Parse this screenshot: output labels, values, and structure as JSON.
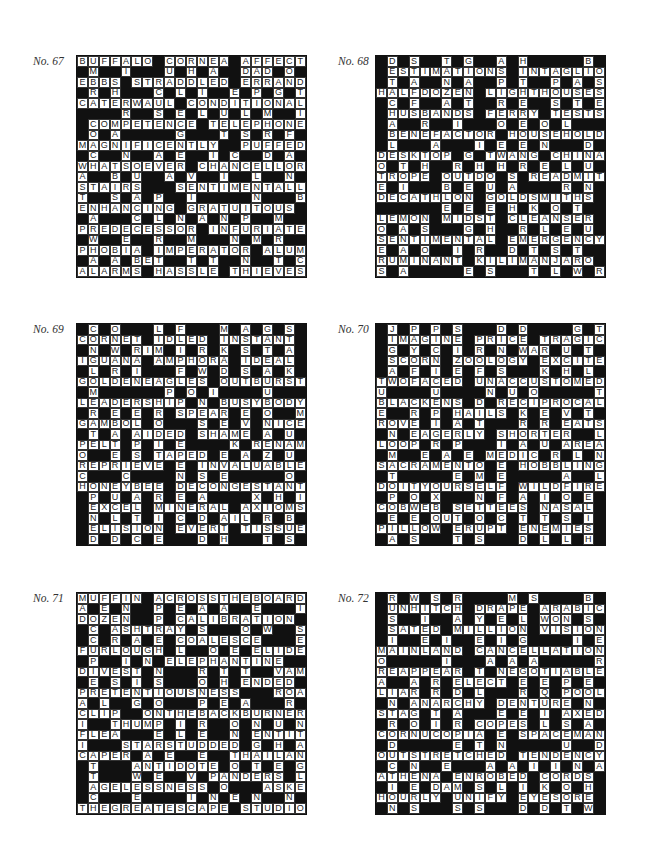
{
  "page": {
    "puzzles": [
      {
        "label": "No. 67",
        "rows": [
          "BUFFALO#CORNEA#AFFECT",
          "#M##I###U#H#A##DAD#O#O",
          "EBBS#STRADDLED#ERRAND",
          "#R#H###C#L#I##E#P#G#T",
          "CATERWAUL#CONDITIONAL",
          "####R##S#E#L#U#L#M##I",
          "#COMPETENCE#TELEPHONE",
          "#O#A#####G###T#S#R#F#I",
          "MAGNIFICENTLY##PUFFED",
          "#C##N##A#E##I#C##D#A#E",
          "WHATSOEVER#CHANCELLOR",
          "A##B#U##A#V##I##L##N#G",
          "STAIRS###SENTIMENTALLY",
          "T##S#A#P##I#####N###B#E",
          "ENHANCING#GRATUITOUS#",
          "#A###C#L#N#A#N#P##M##",
          "PREDECESSOR#INFURIATE",
          "#W##E##R##M###N#M#R##N#R",
          "PHOBIA#IMPERATOR#ALUM",
          "#A#A#BET##T#T##N##T#C",
          "ALARMS#HASSLE#THIEVES"
        ]
      },
      {
        "label": "No. 68",
        "rows": [
          "#D#S##T#G##A#H#####B#B",
          "#ESTIMATIONS#INTAGLIO",
          "#T#A##N#A##P#T##P#A#S",
          "HALFDOZEN#LIGHTHOUSES",
          "#C#F##A#T##R#E##S#T#E",
          "#HUSBANDS#FERRY#TESTS",
          "#A##R##I###O#E#O#L###",
          "#BENEFACTOR#HOUSEHOLD",
          "#L###A###I#E#E#N###D#R",
          "DESKTOP#G#TWANG#CHINA",
          "O#T#H##R#H#H#R#E#L#U#F",
          "TROPE#OUTDO#S#READMIT",
          "E#I###B#E#U#A####R#N#",
          "DECATHLON#GOLDSMITHS",
          "######E#E#E#H#K#O#T",
          "LEMON#MIDST#CLEANSER",
          "O#A#S###G#H##R#L#E#U",
          "SENTIMENTAL#EMERGENCY",
          "E#A#O##I#R##D#T#S#T",
          "RUMINANT#KILIMANJARO",
          "S#A#####E#S###T#L#W#R"
        ]
      },
      {
        "label": "No. 69",
        "rows": [
          "#C#O###L#F###M#A#G#S#",
          "CORNET#IDLED#INSTANT",
          "#N#W#RIM#I#R#K#S#T#A",
          "IGUANA#AMPHORA#IDEAL",
          "#L#R#I###F#W#D#S#A#K",
          "GOLDENEAGLES#OUTBURST",
          "#M######P#O#I####U###H",
          "LEADERSHIP#N#BUSYBODY",
          "#R#E#E#R#SPEAR#E#O##M",
          "GAMBOL#O###S#E#V#NICE",
          "#T#A#AIDED#SHAME#A#U",
          "PELT#P#I#E####K#RENAME",
          "O##E#S#TAPED#E#A#Z#U",
          "REPRIEVE#E#INVALUABLE",
          "C###C####N#S#E#####O",
          "HONEYBEE#DECONGESTANT",
          "#P#U#A#R#E#A####X#H#I",
          "#EXCEL#MINERAL#AXIOMS",
          "#N#L#T#I#C#D#AIL#R#B",
          "#ELISION#EVERT#TISSUE",
          "#D#D#C#E###D#H###T#S"
        ]
      },
      {
        "label": "No. 70",
        "rows": [
          "#J#P#P#S###D#D####G#T",
          "#IMAGINE#PRICE#TRAGIC",
          "#G#Y#C#I#R#N#WAR#U#T",
          "#SCORN#ZOOLOGY#EXCITE",
          "#A#F#I#E#F#S###K#H#L",
          "TWOFACED#UNACCUSTOMED",
          "U####U####N#U#O#####T",
          "BLACKENS#D#RECIPROCAL",
          "E##R#P#HAILS#K#E#V#T",
          "ROVE#I#A#T###R#R#EATS",
          "#N#EAGERLY#SHORTER##L",
          "LOOP#R#P###I#A#U#AREA",
          "#M##E#A#E#MEDIC#R#L#N",
          "SACRAMENTO#E#HOBBLING",
          "#T#####E#M#E#####A##L",
          "DOITYOURSELF#WILDFIRE",
          "#P#O#X###N#F#A#I#O#E",
          "COBWEB#SETTEES#NASAL",
          "#E#E#OUT#O#C#T#T#S#I",
          "PILLOW#ERUPT#ENEMIES",
          "#A#S###T#S###D#L#L#H"
        ]
      },
      {
        "label": "No. 71",
        "rows": [
          "MUFFIN#ACROSSTHEBOARD",
          "A#E#N##P#E#A#A##E###I",
          "DOZEN##P#CALIBRATION",
          "#C#ASHTRAY#S###O#W##S",
          "#C#R#A#E#COALESCE###E",
          "FURLOUGH#L##O#E#ELIDE",
          "#P##I#N#ELEPHANTINE##M",
          "DIVEST#N###R#T#T##VAMP",
          "#E#S#I#S###O#H#ENDED#E",
          "PRETENTIOUSNESS###ROAR",
          "A#L##G#O###P#E#A###R#O",
          "CLIP##ONTHEBACKBURNER",
          "I##THUMP#I#R##O#N#U#N",
          "FLEA###E#L#E##N#ENTITY",
          "I###STARSTUDDED#G#H#A",
          "CAPER#A#E##E##THAILAND",
          "#T###ANTIDOTE#O#T#E#G",
          "#T###W#E##V#PANDERS#L",
          "#AGELESSNESS#O###ASKEW",
          "#C###E####I#N#E#N##N#I#H",
          "THEGREATESCAPE#STUDIO"
        ]
      },
      {
        "label": "No. 72",
        "rows": [
          "#R#W#S#R####M#S####B#V",
          "#UNHITCH#DRAPE#ARABIC",
          "#S##I##A#Y#E#L#WON#S#T",
          "#SATED#MILLION#VISION",
          "#I##E#I##E#I#G####I#E#C",
          "MAINLAND#CANCELLATION",
          "O#####I###A#A#A#####R",
          "REAPPEAR#T#NEGOTIABLE",
          "A##A#R#ELECT#E#E#P#E",
          "LIAR#R#D#L###R#Q#POOL",
          "#N#ANARCHY#DENTURE#N",
          "STAG#T#A###E#E#I#AXED",
          "#R#O#I#R#COPES#L#S#A",
          "CORNUCOPIA#E#SPACEMAN",
          "#D#####E#T#N#####U##D",
          "OUTSTRETCHED#TENDENCY",
          "#C#N##E###A#A#I#I#N#A",
          "ATHENA#ENROBED#CORDS",
          "#I#E#DAM#S#L#I#K#O#H",
          "HOURLY#UNIFY#EYESORE",
          "#N#S###S#S###D#D#T#W"
        ]
      }
    ]
  }
}
